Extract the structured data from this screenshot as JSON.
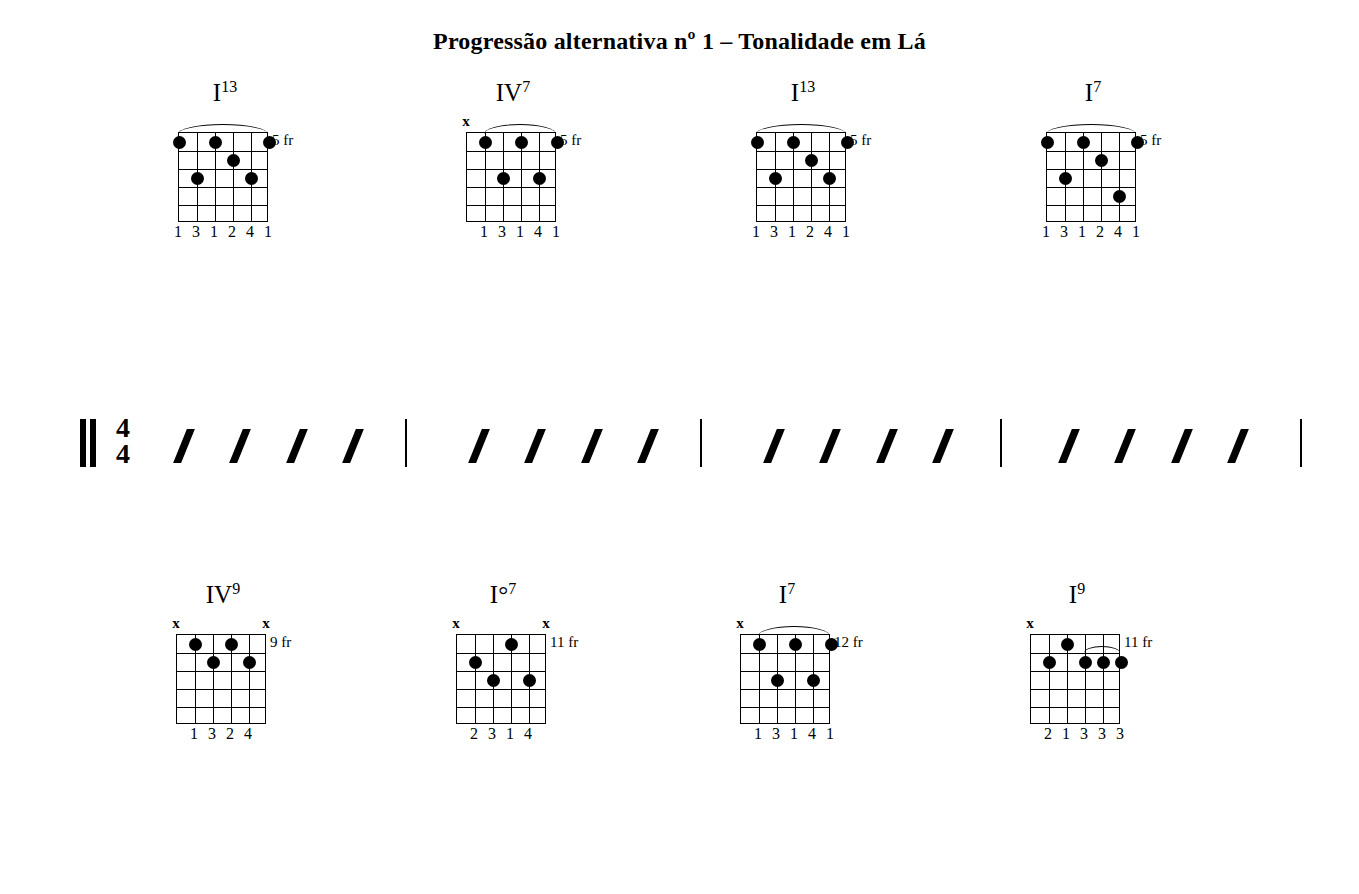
{
  "document": {
    "title": "Progressão alternativa nº 1 – Tonalidade em Lá",
    "time_signature": {
      "top": "4",
      "bottom": "4"
    },
    "beats_per_measure": 4,
    "rhythm_symbol": "slash"
  },
  "systems": [
    {
      "index": 1,
      "has_time_signature": true,
      "chords": [
        {
          "name": "I",
          "extension": "13",
          "flat": false,
          "position": "5 fr",
          "fingers": [
            "1",
            "3",
            "1",
            "2",
            "4",
            "1"
          ],
          "muted": [],
          "barre": {
            "from_string": 6,
            "to_string": 1,
            "fret": 1
          },
          "dots": [
            {
              "string": 6,
              "fret": 1
            },
            {
              "string": 4,
              "fret": 1
            },
            {
              "string": 1,
              "fret": 1
            },
            {
              "string": 3,
              "fret": 2
            },
            {
              "string": 5,
              "fret": 3
            },
            {
              "string": 2,
              "fret": 3
            }
          ]
        },
        {
          "name": "IV",
          "extension": "7",
          "flat": false,
          "position": "5 fr",
          "fingers": [
            "",
            "1",
            "3",
            "1",
            "4",
            "1"
          ],
          "muted": [
            6
          ],
          "barre": {
            "from_string": 5,
            "to_string": 1,
            "fret": 1
          },
          "dots": [
            {
              "string": 5,
              "fret": 1
            },
            {
              "string": 3,
              "fret": 1
            },
            {
              "string": 1,
              "fret": 1
            },
            {
              "string": 4,
              "fret": 3
            },
            {
              "string": 2,
              "fret": 3
            }
          ]
        },
        {
          "name": "I",
          "extension": "13",
          "flat": false,
          "position": "5 fr",
          "fingers": [
            "1",
            "3",
            "1",
            "2",
            "4",
            "1"
          ],
          "muted": [],
          "barre": {
            "from_string": 6,
            "to_string": 1,
            "fret": 1
          },
          "dots": [
            {
              "string": 6,
              "fret": 1
            },
            {
              "string": 4,
              "fret": 1
            },
            {
              "string": 1,
              "fret": 1
            },
            {
              "string": 3,
              "fret": 2
            },
            {
              "string": 5,
              "fret": 3
            },
            {
              "string": 2,
              "fret": 3
            }
          ]
        },
        {
          "name": "I",
          "extension": "7",
          "flat": false,
          "position": "5 fr",
          "fingers": [
            "1",
            "3",
            "1",
            "2",
            "4",
            "1"
          ],
          "muted": [],
          "barre": {
            "from_string": 6,
            "to_string": 1,
            "fret": 1
          },
          "dots": [
            {
              "string": 6,
              "fret": 1
            },
            {
              "string": 4,
              "fret": 1
            },
            {
              "string": 1,
              "fret": 1
            },
            {
              "string": 3,
              "fret": 2
            },
            {
              "string": 5,
              "fret": 3
            },
            {
              "string": 2,
              "fret": 4
            }
          ]
        }
      ]
    },
    {
      "index": 2,
      "has_time_signature": false,
      "chords": [
        {
          "name": "IV",
          "extension": "9",
          "flat": false,
          "position": "9 fr",
          "fingers": [
            "",
            "1",
            "3",
            "2",
            "4",
            ""
          ],
          "muted": [
            6,
            1
          ],
          "barre": null,
          "dots": [
            {
              "string": 5,
              "fret": 1
            },
            {
              "string": 3,
              "fret": 1
            },
            {
              "string": 4,
              "fret": 2
            },
            {
              "string": 2,
              "fret": 2
            }
          ]
        },
        {
          "name": "I°",
          "extension": "7",
          "flat": false,
          "position": "11 fr",
          "fingers": [
            "",
            "2",
            "3",
            "1",
            "4",
            ""
          ],
          "muted": [
            6,
            1
          ],
          "barre": null,
          "dots": [
            {
              "string": 3,
              "fret": 1
            },
            {
              "string": 5,
              "fret": 2
            },
            {
              "string": 4,
              "fret": 3
            },
            {
              "string": 2,
              "fret": 3
            }
          ]
        },
        {
          "name": "I",
          "extension": "7",
          "flat": false,
          "position": "12 fr",
          "fingers": [
            "",
            "1",
            "3",
            "1",
            "4",
            "1"
          ],
          "muted": [
            6
          ],
          "barre": {
            "from_string": 5,
            "to_string": 1,
            "fret": 1
          },
          "dots": [
            {
              "string": 5,
              "fret": 1
            },
            {
              "string": 3,
              "fret": 1
            },
            {
              "string": 1,
              "fret": 1
            },
            {
              "string": 4,
              "fret": 3
            },
            {
              "string": 2,
              "fret": 3
            }
          ]
        },
        {
          "name": "I",
          "extension": "9",
          "flat": false,
          "position": "11 fr",
          "fingers": [
            "",
            "2",
            "1",
            "3",
            "3",
            "3"
          ],
          "muted": [
            6
          ],
          "barre": {
            "from_string": 3,
            "to_string": 1,
            "fret": 2,
            "small": true
          },
          "dots": [
            {
              "string": 4,
              "fret": 1
            },
            {
              "string": 5,
              "fret": 2
            },
            {
              "string": 3,
              "fret": 2
            },
            {
              "string": 2,
              "fret": 2
            },
            {
              "string": 1,
              "fret": 2
            }
          ]
        }
      ]
    },
    {
      "index": 3,
      "has_time_signature": false,
      "chords": [
        {
          "name": "V",
          "extension": "9",
          "flat": false,
          "position": "11 fr",
          "fingers": [
            "",
            "1",
            "3",
            "2",
            "4",
            "4"
          ],
          "muted": [
            6
          ],
          "barre": {
            "from_string": 2,
            "to_string": 1,
            "fret": 2,
            "small": true
          },
          "dots": [
            {
              "string": 5,
              "fret": 1
            },
            {
              "string": 3,
              "fret": 1
            },
            {
              "string": 4,
              "fret": 2
            },
            {
              "string": 2,
              "fret": 2
            },
            {
              "string": 1,
              "fret": 2
            }
          ]
        },
        {
          "name": "IV",
          "extension": "9",
          "flat": false,
          "position": "9 fr",
          "fingers": [
            "",
            "1",
            "3",
            "2",
            "4",
            "4"
          ],
          "muted": [
            6
          ],
          "barre": {
            "from_string": 2,
            "to_string": 1,
            "fret": 2,
            "small": true
          },
          "dots": [
            {
              "string": 5,
              "fret": 1
            },
            {
              "string": 3,
              "fret": 1
            },
            {
              "string": 4,
              "fret": 2
            },
            {
              "string": 2,
              "fret": 2
            },
            {
              "string": 1,
              "fret": 2
            }
          ]
        },
        {
          "name": "I",
          "extension": "7",
          "flat": false,
          "position": "7 fr",
          "fingers": [
            "",
            "1",
            "1",
            "3",
            "2",
            "4"
          ],
          "muted": [
            6
          ],
          "barre": {
            "from_string": 5,
            "to_string": 4,
            "fret": 1,
            "small": true
          },
          "dots": [
            {
              "string": 5,
              "fret": 1
            },
            {
              "string": 4,
              "fret": 1
            },
            {
              "string": 2,
              "fret": 2
            },
            {
              "string": 3,
              "fret": 3
            },
            {
              "string": 1,
              "fret": 3
            }
          ]
        },
        {
          "name": "III",
          "extension": "13",
          "flat": true,
          "position": "8 fr",
          "fingers": [
            "1",
            "",
            "2",
            "3",
            "4",
            ""
          ],
          "muted": [
            5,
            1
          ],
          "barre": null,
          "dots": [
            {
              "string": 6,
              "fret": 1
            },
            {
              "string": 4,
              "fret": 1
            },
            {
              "string": 3,
              "fret": 2
            },
            {
              "string": 2,
              "fret": 3
            }
          ]
        },
        {
          "name": "II",
          "extension": "13",
          "flat": false,
          "position": "7 fr",
          "fingers": [
            "1",
            "",
            "2",
            "3",
            "4",
            ""
          ],
          "muted": [
            5,
            1
          ],
          "barre": null,
          "dots": [
            {
              "string": 6,
              "fret": 1
            },
            {
              "string": 4,
              "fret": 1
            },
            {
              "string": 3,
              "fret": 2
            },
            {
              "string": 2,
              "fret": 3
            }
          ]
        },
        {
          "name": "II",
          "extension": "13",
          "flat": true,
          "position": "6 fr",
          "fingers": [
            "1",
            "",
            "2",
            "3",
            "4",
            ""
          ],
          "muted": [
            5,
            1
          ],
          "barre": null,
          "dots": [
            {
              "string": 6,
              "fret": 1
            },
            {
              "string": 4,
              "fret": 1
            },
            {
              "string": 3,
              "fret": 2
            },
            {
              "string": 2,
              "fret": 3
            }
          ]
        }
      ]
    }
  ],
  "layout": {
    "system_tops": [
      80,
      345,
      600
    ],
    "staff_tops": [
      240,
      508,
      778
    ],
    "chord_lefts": [
      [
        150,
        438,
        728,
        1018
      ],
      [
        148,
        428,
        712,
        1002
      ],
      [
        148,
        428,
        718,
        848,
        1008,
        1148
      ]
    ],
    "measure_bar_x": [
      405,
      700,
      1000,
      1300
    ],
    "staff_start_x": 80,
    "timesig_x": 116,
    "measure_starts": [
      160,
      455,
      750,
      1045
    ]
  }
}
